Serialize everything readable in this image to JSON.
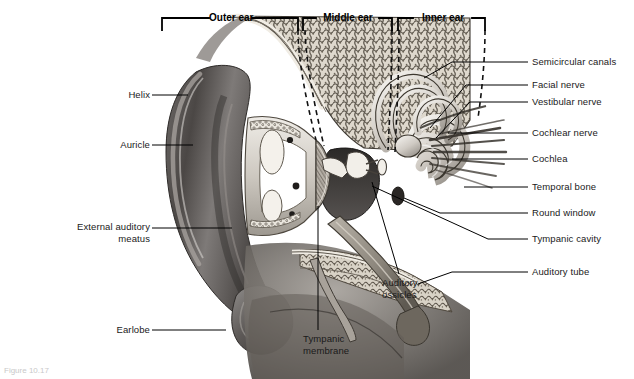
{
  "figure": {
    "caption": "Figure 10.17"
  },
  "regions": [
    {
      "label": "Outer ear",
      "x1": 162,
      "x2": 298
    },
    {
      "label": "Middle ear",
      "x1": 303,
      "x2": 392
    },
    {
      "label": "Inner ear",
      "x1": 398,
      "x2": 485
    }
  ],
  "labels_left": [
    {
      "text": "Helix",
      "x": 118,
      "y": 92,
      "line_x1": 152,
      "line_x2": 188,
      "line_y": 95
    },
    {
      "text": "Auricle",
      "x": 109,
      "y": 142,
      "line_x1": 152,
      "line_x2": 193,
      "line_y": 145
    },
    {
      "text": "External auditory\nmeatus",
      "x": 68,
      "y": 223,
      "line_x1": 152,
      "line_x2": 232,
      "line_y": 228
    },
    {
      "text": "Earlobe",
      "x": 110,
      "y": 327,
      "line_x1": 152,
      "line_x2": 226,
      "line_y": 330
    }
  ],
  "labels_right": [
    {
      "text": "Semicircular canals",
      "x": 532,
      "y": 58,
      "line_y": 62,
      "tip_x": 434,
      "tip_y": 62
    },
    {
      "text": "Facial nerve",
      "x": 532,
      "y": 81,
      "line_y": 85,
      "tip_x": 442,
      "tip_y": 85
    },
    {
      "text": "Vestibular nerve",
      "x": 532,
      "y": 98,
      "line_y": 102,
      "tip_x": 444,
      "tip_y": 102
    },
    {
      "text": "Cochlear nerve",
      "x": 532,
      "y": 129,
      "line_y": 133,
      "tip_x": 430,
      "tip_y": 133
    },
    {
      "text": "Cochlea",
      "x": 532,
      "y": 155,
      "line_y": 159,
      "tip_x": 436,
      "tip_y": 159
    },
    {
      "text": "Temporal bone",
      "x": 532,
      "y": 183,
      "line_y": 187,
      "tip_x": 460,
      "tip_y": 187
    },
    {
      "text": "Round window",
      "x": 532,
      "y": 209,
      "line_y": 213,
      "tip_x": 440,
      "tip_y": 213
    },
    {
      "text": "Tympanic cavity",
      "x": 532,
      "y": 235,
      "line_y": 239,
      "tip_x": 424,
      "tip_y": 213
    },
    {
      "text": "Auditory tube",
      "x": 532,
      "y": 268,
      "line_y": 272,
      "tip_x": 452,
      "tip_y": 272
    }
  ],
  "labels_bottom": [
    {
      "text": "Auditory\nossicles",
      "x": 382,
      "y": 277,
      "line_x": 399,
      "line_y1": 272,
      "line_y2": 196
    },
    {
      "text": "Tympanic\nmembrane",
      "x": 303,
      "y": 333,
      "line_x": 318,
      "line_y1": 328,
      "line_y2": 246
    }
  ],
  "colors": {
    "text": "#1a1a1a",
    "rule": "#000000",
    "background": "#ffffff",
    "art_dark": "#3b3b3b",
    "art_mid": "#8d8d8d",
    "art_light": "#d6d6d6"
  },
  "structures": [
    "auricle",
    "helix",
    "earlobe",
    "external auditory meatus",
    "tympanic membrane",
    "auditory ossicles",
    "tympanic cavity",
    "auditory tube",
    "cochlea",
    "cochlear nerve",
    "vestibular nerve",
    "facial nerve",
    "semicircular canals",
    "round window",
    "temporal bone"
  ]
}
